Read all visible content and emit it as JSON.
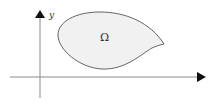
{
  "diagram": {
    "type": "domain-in-plane",
    "region_label": "Ω",
    "y_axis_label": "y",
    "colors": {
      "axis": "#8a8a8a",
      "arrowhead": "#111111",
      "region_fill": "#f1f1f1",
      "region_stroke": "#555555",
      "text": "#333333"
    }
  }
}
